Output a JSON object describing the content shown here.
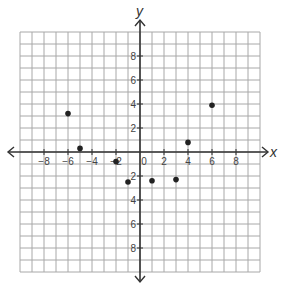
{
  "chart_data": {
    "type": "scatter",
    "title": "",
    "xlabel": "x",
    "ylabel": "y",
    "xlim": [
      -10,
      10
    ],
    "ylim": [
      -10,
      10
    ],
    "grid": true,
    "grid_step": 1,
    "legend": null,
    "x_ticks": [
      -8,
      -6,
      -4,
      -2,
      0,
      2,
      4,
      6,
      8
    ],
    "x_tick_labels": [
      "−8",
      "−6",
      "−4",
      "−2",
      "0",
      "2",
      "4",
      "6",
      "8"
    ],
    "y_ticks": [
      -8,
      -6,
      -4,
      -2,
      2,
      4,
      6,
      8
    ],
    "y_tick_labels": [
      "8",
      "6",
      "4",
      "2",
      "2",
      "4",
      "6",
      "8"
    ],
    "series": [
      {
        "name": "points",
        "points": [
          {
            "x": -6,
            "y": 3.2
          },
          {
            "x": -5,
            "y": 0.3
          },
          {
            "x": -2,
            "y": -0.8
          },
          {
            "x": -1,
            "y": -2.5
          },
          {
            "x": 1,
            "y": -2.4
          },
          {
            "x": 3,
            "y": -2.3
          },
          {
            "x": 4,
            "y": 0.8
          },
          {
            "x": 6,
            "y": 3.9
          }
        ]
      }
    ]
  },
  "colors": {
    "grid": "#a8a8a8",
    "axis": "#333333",
    "point": "#222222",
    "label": "#444444"
  }
}
